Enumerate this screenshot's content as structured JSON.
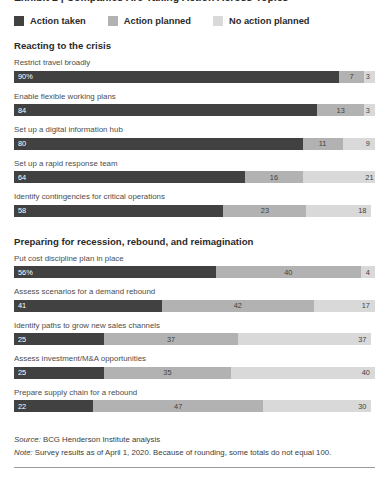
{
  "clipped_title": "Exhibit 2 | Companies Are Taking Action Across Topics",
  "colors": {
    "action_taken": "#414141",
    "action_planned": "#b2b2b2",
    "no_action_planned": "#d9d9d9",
    "text": "#333333",
    "rule": "#9a9a9a"
  },
  "legend": [
    {
      "label": "Action taken",
      "key": "action_taken"
    },
    {
      "label": "Action planned",
      "key": "action_planned"
    },
    {
      "label": "No action planned",
      "key": "no_action_planned"
    }
  ],
  "sections": [
    {
      "title": "Reacting to the crisis",
      "rows": [
        {
          "label": "Restrict travel broadly",
          "taken": "90%",
          "planned": "7",
          "none": "3",
          "taken_v": 90,
          "planned_v": 7,
          "none_v": 3
        },
        {
          "label": "Enable flexible working plans",
          "taken": "84",
          "planned": "13",
          "none": "3",
          "taken_v": 84,
          "planned_v": 13,
          "none_v": 3
        },
        {
          "label": "Set up a digital information hub",
          "taken": "80",
          "planned": "11",
          "none": "9",
          "taken_v": 80,
          "planned_v": 11,
          "none_v": 9
        },
        {
          "label": "Set up a rapid response team",
          "taken": "64",
          "planned": "16",
          "none": "21",
          "taken_v": 64,
          "planned_v": 16,
          "none_v": 21
        },
        {
          "label": "Identify contingencies for critical operations",
          "taken": "58",
          "planned": "23",
          "none": "18",
          "taken_v": 58,
          "planned_v": 23,
          "none_v": 18
        }
      ]
    },
    {
      "title": "Preparing for recession, rebound, and reimagination",
      "rows": [
        {
          "label": "Put cost discipline plan in place",
          "taken": "56%",
          "planned": "40",
          "none": "4",
          "taken_v": 56,
          "planned_v": 40,
          "none_v": 4
        },
        {
          "label": "Assess scenarios for a demand rebound",
          "taken": "41",
          "planned": "42",
          "none": "17",
          "taken_v": 41,
          "planned_v": 42,
          "none_v": 17
        },
        {
          "label": "Identify paths to grow new sales channels",
          "taken": "25",
          "planned": "37",
          "none": "37",
          "taken_v": 25,
          "planned_v": 37,
          "none_v": 37
        },
        {
          "label": "Assess investment/M&A opportunities",
          "taken": "25",
          "planned": "35",
          "none": "40",
          "taken_v": 25,
          "planned_v": 35,
          "none_v": 40
        },
        {
          "label": "Prepare supply chain for a rebound",
          "taken": "22",
          "planned": "47",
          "none": "30",
          "taken_v": 22,
          "planned_v": 47,
          "none_v": 30
        }
      ]
    }
  ],
  "footnotes": {
    "source_label": "Source:",
    "source_text": " BCG Henderson Institute analysis",
    "note_label": "Note:",
    "note_text": " Survey results as of April 1, 2020. Because of rounding, some totals do not equal 100."
  },
  "chart_data": {
    "type": "bar",
    "orientation": "horizontal",
    "stacked": true,
    "unit": "percent",
    "xlim": [
      0,
      100
    ],
    "grid": false,
    "legend_position": "top",
    "series": [
      {
        "name": "Action taken",
        "color": "#414141",
        "values": [
          90,
          84,
          80,
          64,
          58,
          56,
          41,
          25,
          25,
          22
        ]
      },
      {
        "name": "Action planned",
        "color": "#b2b2b2",
        "values": [
          7,
          13,
          11,
          16,
          23,
          40,
          42,
          37,
          35,
          47
        ]
      },
      {
        "name": "No action planned",
        "color": "#d9d9d9",
        "values": [
          3,
          3,
          9,
          21,
          18,
          4,
          17,
          37,
          40,
          30
        ]
      }
    ],
    "categories": [
      "Restrict travel broadly",
      "Enable flexible working plans",
      "Set up a digital information hub",
      "Set up a rapid response team",
      "Identify contingencies for critical operations",
      "Put cost discipline plan in place",
      "Assess scenarios for a demand rebound",
      "Identify paths to grow new sales channels",
      "Assess investment/M&A opportunities",
      "Prepare supply chain for a rebound"
    ],
    "group_labels": [
      "Reacting to the crisis",
      "Preparing for recession, rebound, and reimagination"
    ],
    "xlabel": "",
    "ylabel": "",
    "title": "",
    "annotations": [
      "Source: BCG Henderson Institute analysis",
      "Note: Survey results as of April 1, 2020. Because of rounding, some totals do not equal 100."
    ]
  }
}
